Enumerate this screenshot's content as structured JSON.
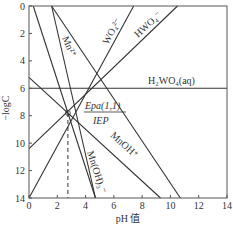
{
  "chart_data": {
    "type": "line",
    "title": "",
    "xlabel": "pH 值",
    "ylabel": "−logC",
    "xlim": [
      0,
      14
    ],
    "ylim": [
      0,
      14
    ],
    "y_inverted": true,
    "grid": false,
    "x_ticks": [
      "0",
      "2",
      "4",
      "6",
      "8",
      "10",
      "12",
      "14"
    ],
    "y_ticks": [
      "0",
      "2",
      "4",
      "6",
      "8",
      "10",
      "12",
      "14"
    ],
    "series": [
      {
        "name": "Mn²⁺",
        "points": [
          [
            0.3,
            0
          ],
          [
            4.7,
            14
          ]
        ]
      },
      {
        "name": "Mn(OH)₃⁻",
        "points": [
          [
            1.6,
            0
          ],
          [
            4.7,
            14
          ]
        ]
      },
      {
        "name": "WO₄²⁻",
        "points": [
          [
            0,
            14
          ],
          [
            7.4,
            0
          ]
        ]
      },
      {
        "name": "HWO₄⁻",
        "points": [
          [
            0,
            10.4
          ],
          [
            10.5,
            0
          ]
        ]
      },
      {
        "name": "H₂WO₄(aq)",
        "points": [
          [
            0,
            6
          ],
          [
            14,
            6
          ]
        ]
      },
      {
        "name": "MnOH⁺",
        "points": [
          [
            0,
            5.2
          ],
          [
            9.3,
            14
          ]
        ]
      },
      {
        "name": "Mn(OH)₂ line",
        "points": [
          [
            1.6,
            0
          ],
          [
            10.7,
            14
          ]
        ]
      }
    ],
    "annotations": [
      {
        "text": "Epa(1,1)",
        "x": 4.1,
        "y": 7.5
      },
      {
        "text": "IEP",
        "x": 4.1,
        "y": 8.6
      },
      {
        "text": "dashed IEP marker",
        "x": 2.75,
        "y_from": 7.8,
        "y_to": 14
      }
    ],
    "intersection_point": {
      "pH": 2.75,
      "minus_logC": 7.8
    }
  },
  "labels": {
    "ylabel": "−logC",
    "xlabel": "pH 值",
    "mn2": "Mn²⁺",
    "wo4": "WO₄²⁻",
    "hwo4": "HWO₄⁻",
    "h2wo4": "H₂WO₄(aq)",
    "epa": "Epa(1,1)",
    "iep": "IEP",
    "mnoh": "MnOH⁺",
    "mnoh3": "Mn(OH)₃⁻"
  }
}
